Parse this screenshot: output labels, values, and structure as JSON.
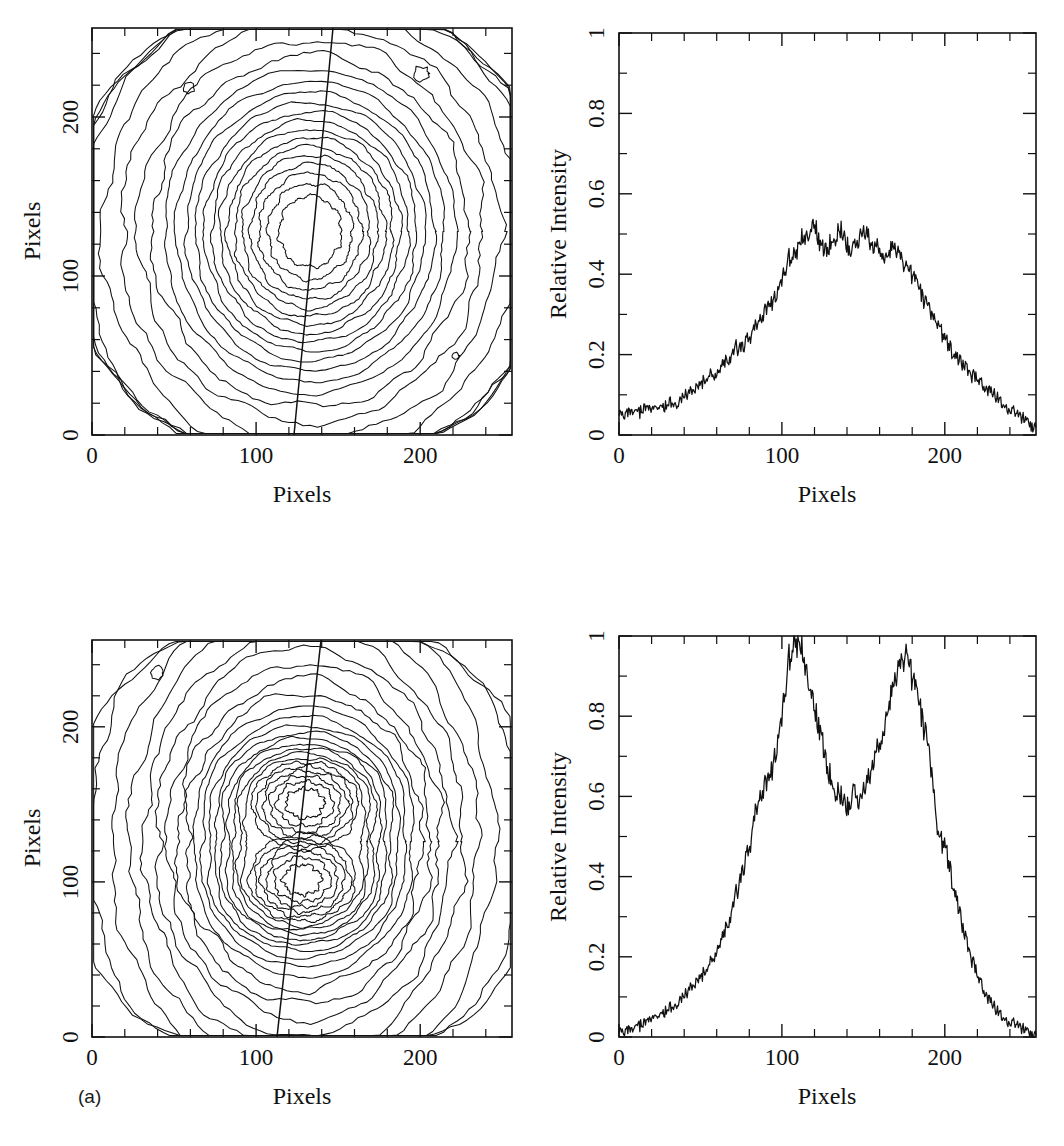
{
  "figure": {
    "panel_letter": "(a)",
    "caption_fragment": "",
    "axis_titles": {
      "pixels": "Pixels",
      "relative_intensity": "Relative Intensity"
    }
  },
  "chart_data": [
    {
      "id": "top-left-contour",
      "type": "contour",
      "title": "",
      "xlabel": "Pixels",
      "ylabel": "Pixels",
      "xlim": [
        0,
        256
      ],
      "ylim": [
        0,
        256
      ],
      "xticks": [
        0,
        100,
        200
      ],
      "yticks": [
        0,
        100,
        200
      ],
      "xtick_labels": [
        "0",
        "100",
        "200"
      ],
      "ytick_labels": [
        "0",
        "100",
        "200"
      ],
      "minor_tick_step": 20,
      "grid": false,
      "legend": "none",
      "n_levels": 22,
      "annotations": [
        "slit line overlaid, near-vertical, slight tilt"
      ],
      "slit_line": {
        "x0": 122,
        "y0": 0,
        "x1": 146,
        "y1": 256
      },
      "peak_center": [
        133,
        128
      ],
      "structure": "single broad elongated peak with noisy inner contours"
    },
    {
      "id": "top-right-profile",
      "type": "line",
      "title": "",
      "xlabel": "Pixels",
      "ylabel": "Relative Intensity",
      "xlim": [
        0,
        256
      ],
      "ylim": [
        0,
        1
      ],
      "xticks": [
        0,
        100,
        200
      ],
      "yticks": [
        0,
        0.2,
        0.4,
        0.6,
        0.8,
        1
      ],
      "xtick_labels": [
        "0",
        "100",
        "200"
      ],
      "ytick_labels": [
        "0",
        "0.2",
        "0.4",
        "0.6",
        "0.8",
        "1"
      ],
      "grid": false,
      "legend": "none",
      "series": [
        {
          "name": "Profile along slit",
          "x": [
            0,
            4,
            8,
            12,
            16,
            20,
            24,
            28,
            32,
            36,
            40,
            44,
            48,
            52,
            56,
            60,
            64,
            68,
            72,
            76,
            80,
            84,
            88,
            92,
            96,
            100,
            104,
            108,
            112,
            116,
            120,
            124,
            128,
            132,
            136,
            140,
            144,
            148,
            152,
            156,
            160,
            164,
            168,
            172,
            176,
            180,
            184,
            188,
            192,
            196,
            200,
            204,
            208,
            212,
            216,
            220,
            224,
            228,
            232,
            236,
            240,
            244,
            248,
            252,
            256
          ],
          "values": [
            0.045,
            0.055,
            0.062,
            0.058,
            0.068,
            0.063,
            0.072,
            0.07,
            0.082,
            0.078,
            0.095,
            0.105,
            0.12,
            0.135,
            0.15,
            0.152,
            0.175,
            0.195,
            0.215,
            0.222,
            0.25,
            0.268,
            0.29,
            0.32,
            0.355,
            0.4,
            0.435,
            0.455,
            0.48,
            0.5,
            0.52,
            0.47,
            0.455,
            0.49,
            0.505,
            0.475,
            0.46,
            0.49,
            0.51,
            0.48,
            0.455,
            0.43,
            0.47,
            0.455,
            0.42,
            0.4,
            0.37,
            0.33,
            0.3,
            0.275,
            0.24,
            0.21,
            0.19,
            0.175,
            0.15,
            0.135,
            0.12,
            0.105,
            0.09,
            0.075,
            0.062,
            0.05,
            0.042,
            0.03,
            0.02
          ]
        }
      ],
      "peak_value": 0.55,
      "peak_x": 120,
      "structure": "single broad noisy peak plateau near 0.45-0.55"
    },
    {
      "id": "bottom-left-contour",
      "type": "contour",
      "title": "",
      "xlabel": "Pixels",
      "ylabel": "Pixels",
      "xlim": [
        0,
        256
      ],
      "ylim": [
        0,
        256
      ],
      "xticks": [
        0,
        100,
        200
      ],
      "yticks": [
        0,
        100,
        200
      ],
      "xtick_labels": [
        "0",
        "100",
        "200"
      ],
      "ytick_labels": [
        "0",
        "100",
        "200"
      ],
      "minor_tick_step": 20,
      "grid": false,
      "legend": "none",
      "n_levels": 24,
      "annotations": [
        "slit line overlaid, near-vertical, slight tilt"
      ],
      "slit_line": {
        "x0": 113,
        "y0": 0,
        "x1": 140,
        "y1": 256
      },
      "peak_centers": [
        [
          128,
          100
        ],
        [
          130,
          152
        ]
      ],
      "structure": "two distinct peaks along vertical axis, elongated envelope"
    },
    {
      "id": "bottom-right-profile",
      "type": "line",
      "title": "",
      "xlabel": "Pixels",
      "ylabel": "Relative Intensity",
      "xlim": [
        0,
        256
      ],
      "ylim": [
        0,
        1
      ],
      "xticks": [
        0,
        100,
        200
      ],
      "yticks": [
        0,
        0.2,
        0.4,
        0.6,
        0.8,
        1
      ],
      "xtick_labels": [
        "0",
        "100",
        "200"
      ],
      "ytick_labels": [
        "0",
        "0.2",
        "0.4",
        "0.6",
        "0.8",
        "1"
      ],
      "grid": false,
      "legend": "none",
      "series": [
        {
          "name": "Profile along slit",
          "x": [
            0,
            4,
            8,
            12,
            16,
            20,
            24,
            28,
            32,
            36,
            40,
            44,
            48,
            52,
            56,
            60,
            64,
            68,
            72,
            76,
            80,
            84,
            88,
            92,
            96,
            100,
            104,
            108,
            112,
            116,
            120,
            124,
            128,
            132,
            136,
            140,
            144,
            148,
            152,
            156,
            160,
            164,
            168,
            172,
            176,
            180,
            184,
            188,
            192,
            196,
            200,
            204,
            208,
            212,
            216,
            220,
            224,
            228,
            232,
            236,
            240,
            244,
            248,
            252,
            256
          ],
          "values": [
            0.008,
            0.018,
            0.022,
            0.03,
            0.036,
            0.045,
            0.055,
            0.062,
            0.075,
            0.085,
            0.1,
            0.12,
            0.14,
            0.16,
            0.185,
            0.215,
            0.25,
            0.3,
            0.355,
            0.42,
            0.48,
            0.56,
            0.605,
            0.64,
            0.72,
            0.82,
            0.93,
            1.0,
            0.96,
            0.9,
            0.81,
            0.76,
            0.66,
            0.62,
            0.595,
            0.575,
            0.61,
            0.58,
            0.64,
            0.7,
            0.72,
            0.78,
            0.87,
            0.93,
            0.96,
            0.9,
            0.84,
            0.76,
            0.66,
            0.5,
            0.48,
            0.4,
            0.33,
            0.26,
            0.2,
            0.15,
            0.115,
            0.085,
            0.062,
            0.048,
            0.035,
            0.028,
            0.02,
            0.012,
            0.005
          ]
        }
      ],
      "peak_values": [
        1.0,
        0.97
      ],
      "peak_x": [
        105,
        162
      ],
      "trough_value": 0.57,
      "trough_x": 133,
      "structure": "double-peaked profile with central trough near 0.57"
    }
  ]
}
